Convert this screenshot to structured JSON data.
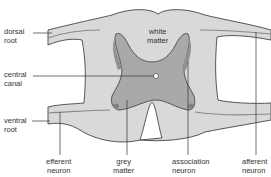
{
  "diagram": {
    "type": "spinal-cord-cross-section",
    "colors": {
      "white_matter": "#d9d9d9",
      "grey_matter": "#a9a9a9",
      "grey_matter_horn": "#959595",
      "nerve_fill": "#e6e6e6",
      "outline": "#555555",
      "leader_line": "#333333",
      "central_canal": "#ffffff"
    },
    "labels": {
      "dorsal_root": "dorsal\nroot",
      "white_matter": "white\nmatter",
      "central_canal": "central\ncanal",
      "ventral_root": "ventral\nroot",
      "efferent_neuron": "efferent\nneuron",
      "grey_matter": "grey\nmatter",
      "association_neuron": "association\nneuron",
      "afferent_neuron": "afferent\nneuron"
    }
  }
}
